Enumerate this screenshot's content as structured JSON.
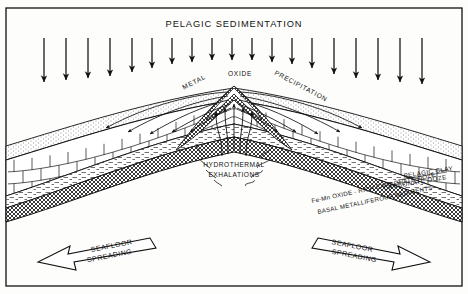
{
  "figure": {
    "title": "PELAGIC SEDIMENTATION",
    "frame_color": "#111111",
    "background": "#fdfdfb"
  },
  "annotations": {
    "metal": "METAL",
    "oxide": "OXIDE",
    "precipitation": "PRECIPITATION",
    "hydrothermal": "HYDROTHERMAL",
    "exhalations": "EXHALATIONS",
    "spreading_left_line1": "SEAFLOOR",
    "spreading_left_line2": "SPREADING",
    "spreading_right_line1": "SEAFLOOR",
    "spreading_right_line2": "SPREADING"
  },
  "strata_labels": {
    "pelagic_clay": "PELAGIC CLAY",
    "carbonate_ooze": "CARBONATE OOZE",
    "fe_mn_oxide": "Fe-Mn OXIDE - RICH CARBONATE OOZE",
    "basal_metalliferous": "BASAL METALLIFEROUS SEDIMENTS"
  },
  "icons": {
    "sedimentation_arrow": "down-arrow-icon",
    "precipitation_arrow": "curved-arrow-icon",
    "vent_plume": "upward-plume-icon",
    "spreading_arrow_left": "hollow-arrow-left-icon",
    "spreading_arrow_right": "hollow-arrow-right-icon"
  },
  "chart_data": {
    "type": "diagram",
    "title": "PELAGIC SEDIMENTATION",
    "sedimentation_arrows": {
      "count": 19,
      "x_positions": [
        44,
        66,
        88,
        110,
        132,
        152,
        172,
        192,
        212,
        232,
        252,
        272,
        292,
        312,
        334,
        356,
        378,
        400,
        422
      ],
      "y_start": 38,
      "y_end": [
        82,
        80,
        78,
        76,
        72,
        68,
        64,
        62,
        60,
        60,
        60,
        62,
        64,
        68,
        74,
        78,
        80,
        82,
        84
      ]
    },
    "layers": [
      {
        "name": "PELAGIC CLAY",
        "pattern": "stipple",
        "order": 1
      },
      {
        "name": "CARBONATE OOZE",
        "pattern": "brick",
        "order": 2
      },
      {
        "name": "Fe-Mn OXIDE - RICH CARBONATE OOZE",
        "pattern": "dash",
        "order": 3
      },
      {
        "name": "BASAL METALLIFEROUS SEDIMENTS",
        "pattern": "crosshatch",
        "order": 4
      }
    ],
    "ridge_apex": {
      "x": 234,
      "y": 88
    },
    "spreading_directions": [
      "left",
      "right"
    ]
  }
}
